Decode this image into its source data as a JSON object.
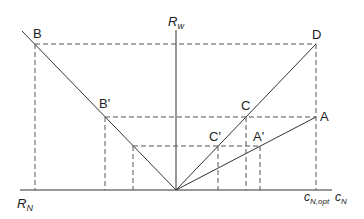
{
  "diagram": {
    "type": "geometric-construction",
    "axes": {
      "vertical": {
        "label": "R",
        "subscript": "w"
      },
      "horizontal_left": {
        "label": "R",
        "subscript": "N"
      },
      "horizontal_right": {
        "label": "c",
        "subscript": "N"
      },
      "tick_label": {
        "label": "c",
        "subscript": "N,opt"
      }
    },
    "points": {
      "B": "B",
      "B_prime": "B'",
      "C": "C",
      "C_prime": "C'",
      "D": "D",
      "A": "A",
      "A_prime": "A'"
    },
    "colors": {
      "line": "#333333",
      "dashed": "#555555",
      "text": "#222222",
      "background": "#ffffff"
    }
  }
}
